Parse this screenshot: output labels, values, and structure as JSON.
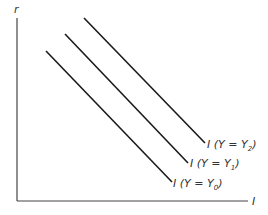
{
  "axes": {
    "y_label": "r",
    "x_label": "I"
  },
  "curves": [
    {
      "id": "y0",
      "label_prefix": "I (Y = Y",
      "subscript": "0",
      "label_suffix": ")",
      "x1": 46,
      "y1": 51,
      "x2": 172,
      "y2": 182
    },
    {
      "id": "y1",
      "label_prefix": "I (Y = Y",
      "subscript": "1",
      "label_suffix": ")",
      "x1": 65,
      "y1": 34,
      "x2": 188,
      "y2": 163
    },
    {
      "id": "y2",
      "label_prefix": "I (Y = Y",
      "subscript": "2",
      "label_suffix": ")",
      "x1": 84,
      "y1": 18,
      "x2": 205,
      "y2": 143
    }
  ],
  "colors": {
    "line": "#1a1a1a",
    "axis": "#333333",
    "text": "#333333"
  }
}
